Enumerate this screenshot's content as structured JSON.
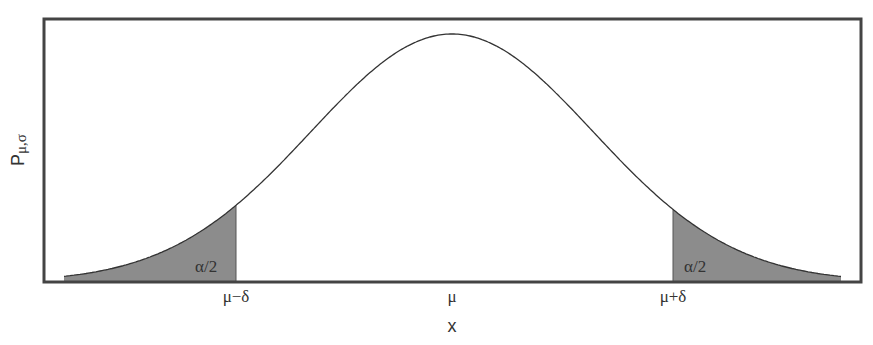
{
  "figure": {
    "type": "normal-distribution-two-tailed",
    "ylabel_main": "P",
    "ylabel_sub": "μ,σ",
    "xlabel": "x",
    "ticks": [
      {
        "label": "μ−δ",
        "x": 236
      },
      {
        "label": "μ",
        "x": 452
      },
      {
        "label": "μ+δ",
        "x": 673
      }
    ],
    "tail_labels": {
      "left": "α/2",
      "right": "α/2"
    },
    "colors": {
      "frame": "#444444",
      "curve": "#333333",
      "tail_fill": "#8c8c8c",
      "text": "#333333"
    },
    "geometry": {
      "frame": {
        "left": 44,
        "top": 19,
        "right": 861,
        "bottom": 282
      },
      "mu_px": 452,
      "sigma_px": 141,
      "peak_height_px": 248,
      "left_cut_px": 236,
      "right_cut_px": 673
    }
  }
}
